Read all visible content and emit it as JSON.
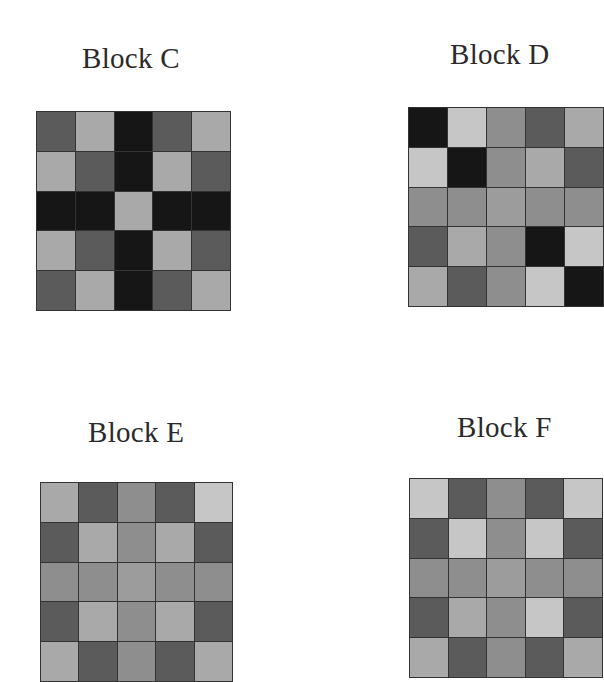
{
  "palette": {
    "K": "#161616",
    "D": "#5b5b5b",
    "M": "#8e8e8e",
    "L": "#a9a9a9",
    "W": "#c6c6c6",
    "C": "#9c9c9c"
  },
  "blocks": [
    {
      "title": "Block C",
      "grid": [
        [
          "D",
          "L",
          "K",
          "D",
          "L"
        ],
        [
          "L",
          "D",
          "K",
          "L",
          "D"
        ],
        [
          "K",
          "K",
          "L",
          "K",
          "K"
        ],
        [
          "L",
          "D",
          "K",
          "L",
          "D"
        ],
        [
          "D",
          "L",
          "K",
          "D",
          "L"
        ]
      ]
    },
    {
      "title": "Block D",
      "grid": [
        [
          "K",
          "W",
          "M",
          "D",
          "L"
        ],
        [
          "W",
          "K",
          "M",
          "L",
          "D"
        ],
        [
          "M",
          "M",
          "C",
          "M",
          "M"
        ],
        [
          "D",
          "L",
          "M",
          "K",
          "W"
        ],
        [
          "L",
          "D",
          "M",
          "W",
          "K"
        ]
      ]
    },
    {
      "title": "Block E",
      "grid": [
        [
          "L",
          "D",
          "M",
          "D",
          "W"
        ],
        [
          "D",
          "L",
          "M",
          "L",
          "D"
        ],
        [
          "M",
          "M",
          "C",
          "M",
          "M"
        ],
        [
          "D",
          "L",
          "M",
          "L",
          "D"
        ],
        [
          "L",
          "D",
          "M",
          "D",
          "L"
        ]
      ]
    },
    {
      "title": "Block F",
      "grid": [
        [
          "W",
          "D",
          "M",
          "D",
          "W"
        ],
        [
          "D",
          "W",
          "M",
          "W",
          "D"
        ],
        [
          "M",
          "M",
          "C",
          "M",
          "M"
        ],
        [
          "D",
          "L",
          "M",
          "W",
          "D"
        ],
        [
          "L",
          "D",
          "M",
          "D",
          "L"
        ]
      ]
    }
  ]
}
